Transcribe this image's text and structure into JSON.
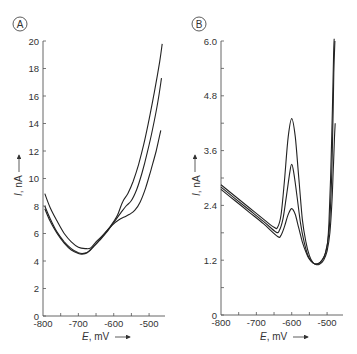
{
  "chart_data": [
    {
      "type": "line",
      "panel": "A",
      "title": "",
      "xlabel": "E, mV",
      "ylabel": "I, nA",
      "xlim": [
        -800,
        -455
      ],
      "ylim": [
        0,
        20
      ],
      "xticks": [
        -800,
        -750,
        -700,
        -650,
        -600,
        -550,
        -500
      ],
      "xtick_labels": [
        "-800",
        "",
        "-700",
        "",
        "-600",
        "",
        "-500"
      ],
      "yticks": [
        0,
        2,
        4,
        6,
        8,
        10,
        12,
        14,
        16,
        18,
        20
      ],
      "ytick_labels": [
        "0",
        "2",
        "4",
        "6",
        "8",
        "10",
        "12",
        "14",
        "16",
        "18",
        "20"
      ],
      "grid": false,
      "series": [
        {
          "name": "curve 1",
          "x": [
            -795,
            -780,
            -760,
            -740,
            -720,
            -700,
            -680,
            -665,
            -650,
            -630,
            -610,
            -590,
            -575,
            -560,
            -545,
            -530,
            -515,
            -500,
            -485,
            -470,
            -463
          ],
          "y": [
            8.9,
            7.9,
            6.9,
            6.0,
            5.4,
            5.0,
            4.9,
            4.95,
            5.4,
            5.9,
            6.5,
            7.3,
            8.3,
            8.9,
            9.8,
            11.0,
            12.5,
            14.3,
            16.3,
            18.5,
            19.8
          ]
        },
        {
          "name": "curve 2",
          "x": [
            -795,
            -780,
            -760,
            -740,
            -720,
            -700,
            -685,
            -670,
            -655,
            -640,
            -620,
            -600,
            -580,
            -565,
            -550,
            -535,
            -520,
            -505,
            -490,
            -475,
            -465
          ],
          "y": [
            8.0,
            7.1,
            6.1,
            5.4,
            4.9,
            4.6,
            4.55,
            4.7,
            5.1,
            5.5,
            6.1,
            6.8,
            7.5,
            8.0,
            8.4,
            9.2,
            10.4,
            11.9,
            13.6,
            15.6,
            17.3
          ]
        },
        {
          "name": "curve 3",
          "x": [
            -795,
            -780,
            -760,
            -740,
            -720,
            -700,
            -690,
            -675,
            -660,
            -645,
            -625,
            -605,
            -585,
            -570,
            -555,
            -540,
            -525,
            -510,
            -495,
            -480,
            -467
          ],
          "y": [
            7.8,
            6.9,
            6.0,
            5.3,
            4.8,
            4.55,
            4.5,
            4.6,
            5.0,
            5.4,
            6.0,
            6.6,
            7.0,
            7.2,
            7.4,
            7.7,
            8.3,
            9.3,
            10.6,
            12.0,
            13.5
          ]
        }
      ]
    },
    {
      "type": "line",
      "panel": "B",
      "title": "",
      "xlabel": "E, mV",
      "ylabel": "I, nA",
      "xlim": [
        -800,
        -455
      ],
      "ylim": [
        0,
        6.0
      ],
      "xticks": [
        -800,
        -750,
        -700,
        -650,
        -600,
        -550,
        -500
      ],
      "xtick_labels": [
        "-800",
        "",
        "-700",
        "",
        "-600",
        "",
        "-500"
      ],
      "yticks": [
        0,
        0.6,
        1.2,
        1.8,
        2.4,
        3.0,
        3.6,
        4.2,
        4.8,
        5.4,
        6.0
      ],
      "ytick_labels": [
        "0",
        "",
        "1.2",
        "",
        "2.4",
        "",
        "3.6",
        "",
        "4.8",
        "",
        "6.0"
      ],
      "grid": false,
      "series": [
        {
          "name": "curve 1",
          "x": [
            -800,
            -760,
            -720,
            -680,
            -650,
            -640,
            -630,
            -620,
            -610,
            -600,
            -590,
            -580,
            -570,
            -560,
            -550,
            -540,
            -530,
            -520,
            -510,
            -500,
            -495,
            -490,
            -485,
            -482,
            -480
          ],
          "y": [
            2.85,
            2.6,
            2.35,
            2.1,
            1.92,
            1.92,
            2.2,
            3.0,
            3.9,
            4.3,
            3.9,
            3.0,
            2.1,
            1.6,
            1.3,
            1.15,
            1.12,
            1.15,
            1.25,
            1.5,
            2.0,
            3.0,
            4.5,
            5.6,
            6.05
          ]
        },
        {
          "name": "curve 2",
          "x": [
            -800,
            -760,
            -720,
            -680,
            -645,
            -635,
            -625,
            -615,
            -605,
            -600,
            -595,
            -585,
            -575,
            -565,
            -555,
            -545,
            -535,
            -525,
            -515,
            -505,
            -495,
            -488,
            -484,
            -481,
            -478
          ],
          "y": [
            2.8,
            2.55,
            2.3,
            2.05,
            1.82,
            1.85,
            2.1,
            2.6,
            3.15,
            3.3,
            3.15,
            2.6,
            2.0,
            1.6,
            1.32,
            1.18,
            1.12,
            1.12,
            1.2,
            1.35,
            1.8,
            2.8,
            4.0,
            5.3,
            6.0
          ]
        },
        {
          "name": "curve 3",
          "x": [
            -800,
            -760,
            -720,
            -680,
            -640,
            -630,
            -620,
            -610,
            -600,
            -590,
            -580,
            -570,
            -560,
            -550,
            -540,
            -530,
            -520,
            -510,
            -500,
            -492,
            -486,
            -482,
            -479,
            -477
          ],
          "y": [
            2.75,
            2.5,
            2.25,
            2.0,
            1.72,
            1.75,
            1.95,
            2.2,
            2.33,
            2.2,
            1.9,
            1.6,
            1.38,
            1.22,
            1.14,
            1.1,
            1.12,
            1.2,
            1.4,
            1.8,
            2.5,
            3.3,
            3.9,
            4.2
          ]
        }
      ]
    }
  ],
  "panels": [
    {
      "letter": "A",
      "xlabel_italic": "E",
      "xlabel_unit": ", mV",
      "ylabel_italic": "I",
      "ylabel_unit": ", nA"
    },
    {
      "letter": "B",
      "xlabel_italic": "E",
      "xlabel_unit": ", mV",
      "ylabel_italic": "I",
      "ylabel_unit": ", nA"
    }
  ]
}
